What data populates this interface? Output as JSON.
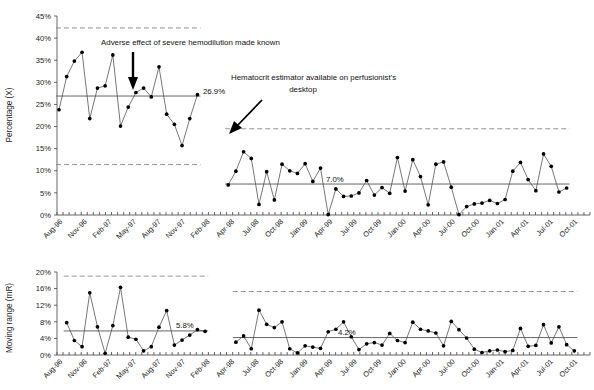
{
  "figure": {
    "title": "",
    "background": "#ffffff"
  },
  "colors": {
    "point": "#000000",
    "series_line": "#4a4a4a",
    "center_line": "#666666",
    "control_limit": "#8a8a8a",
    "axis": "#555555",
    "text": "#111111"
  },
  "chart_data": [
    {
      "type": "line",
      "name": "individuals-chart",
      "title": "",
      "xlabel": "",
      "ylabel": "Percentage (X)",
      "ylim": [
        0,
        45
      ],
      "ytick_labels": [
        "0%",
        "5%",
        "10%",
        "15%",
        "20%",
        "25%",
        "30%",
        "35%",
        "40%",
        "45%"
      ],
      "ytick_values": [
        0,
        5,
        10,
        15,
        20,
        25,
        30,
        35,
        40,
        45
      ],
      "grid": false,
      "legend": "none",
      "x_tick_labels": [
        "Aug-96",
        "Nov-96",
        "Feb-97",
        "May-97",
        "Aug-97",
        "Nov-97",
        "Feb-98",
        "Apr-98",
        "Jul-98",
        "Oct-98",
        "Jan-99",
        "Apr-99",
        "Jul-99",
        "Oct-99",
        "Jan-00",
        "Apr-00",
        "Jul-00",
        "Oct-00",
        "Jan-01",
        "Apr-01",
        "Jul-01",
        "Oct-01"
      ],
      "phases": [
        {
          "name": "phase-1",
          "center_line": 26.9,
          "center_label": "26.9%",
          "upper_control_limit": 42.3,
          "lower_control_limit": 11.4,
          "start_index": 0,
          "values": [
            23.8,
            31.3,
            34.8,
            36.8,
            21.8,
            28.7,
            29.2,
            36.2,
            20.1,
            24.4,
            27.7,
            28.7,
            26.7,
            33.5,
            22.8,
            20.5,
            15.7,
            21.8,
            27.2
          ]
        },
        {
          "name": "phase-2",
          "center_line": 7.0,
          "center_label": "7.0%",
          "upper_control_limit": 19.5,
          "lower_control_limit": null,
          "start_index": 22,
          "values": [
            6.8,
            9.9,
            14.3,
            12.8,
            2.4,
            9.8,
            3.4,
            11.5,
            10.0,
            9.4,
            11.6,
            7.6,
            10.6,
            0.1,
            5.9,
            4.2,
            4.3,
            5.0,
            7.8,
            4.5,
            6.2,
            4.9,
            13.0,
            5.4,
            12.5,
            8.7,
            2.3,
            11.5,
            12.0,
            6.3,
            0.1,
            1.9,
            2.5,
            2.7,
            3.3,
            2.6,
            3.5,
            9.9,
            11.9,
            8.0,
            5.5,
            13.8,
            11.0,
            5.2,
            6.1
          ]
        }
      ]
    },
    {
      "type": "line",
      "name": "moving-range-chart",
      "title": "",
      "xlabel": "",
      "ylabel": "Moving range (mR)",
      "ylim": [
        0,
        20
      ],
      "ytick_labels": [
        "0%",
        "4%",
        "8%",
        "12%",
        "16%",
        "20%"
      ],
      "ytick_values": [
        0,
        4,
        8,
        12,
        16,
        20
      ],
      "grid": false,
      "legend": "none",
      "x_tick_labels": [
        "Aug-96",
        "Nov-96",
        "Feb-97",
        "May-97",
        "Aug-97",
        "Nov-97",
        "Feb-98",
        "Apr-98",
        "Jul-98",
        "Oct-98",
        "Jan-99",
        "Apr-99",
        "Jul-99",
        "Oct-99",
        "Jan-00",
        "Apr-00",
        "Jul-00",
        "Oct-00",
        "Jan-01",
        "Apr-01",
        "Jul-01",
        "Oct-01"
      ],
      "phases": [
        {
          "name": "phase-1",
          "center_line": 5.8,
          "center_label": "5.8%",
          "upper_control_limit": 19.0,
          "start_index": 1,
          "values": [
            7.8,
            3.5,
            2.0,
            15.0,
            6.8,
            0.4,
            7.1,
            16.3,
            4.3,
            3.8,
            1.0,
            2.0,
            6.7,
            10.7,
            2.4,
            3.6,
            4.8,
            6.1,
            5.7
          ]
        },
        {
          "name": "phase-2",
          "center_line": 4.2,
          "center_label": "4.2%",
          "upper_control_limit": 15.3,
          "start_index": 23,
          "values": [
            3.1,
            4.6,
            1.5,
            10.8,
            7.4,
            6.6,
            8.0,
            1.5,
            0.5,
            2.2,
            1.9,
            1.6,
            5.6,
            6.2,
            8.0,
            4.4,
            1.3,
            2.7,
            3.0,
            2.4,
            5.2,
            3.5,
            3.0,
            7.9,
            6.2,
            5.8,
            5.3,
            2.2,
            8.1,
            6.1,
            4.1,
            1.4,
            0.6,
            1.0,
            1.2,
            0.8,
            1.1,
            6.4,
            2.1,
            2.3,
            7.3,
            2.9,
            6.8,
            2.5,
            1.0
          ]
        }
      ]
    }
  ],
  "annotations": [
    {
      "id": "annotation-hemodilution",
      "text": "Adverse effect of severe hemodilution made known",
      "arrow": "down-arrow"
    },
    {
      "id": "annotation-hematocrit-estimator",
      "line1": "Hematocrit estimator available on perfusionist's",
      "line2": "desktop",
      "arrow": "diagonal-arrow"
    }
  ]
}
